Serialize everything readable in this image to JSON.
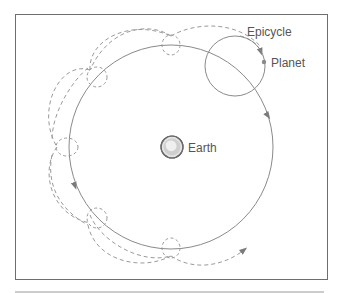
{
  "diagram": {
    "type": "epicycle-model",
    "labels": {
      "epicycle": "Epicycle",
      "planet": "Planet",
      "earth": "Earth"
    },
    "colors": {
      "line": "#8a8a8a",
      "dashed": "#9a9a9a",
      "frame": "#6e6e6e",
      "text": "#555555",
      "earth_fill": "#d4d4d4",
      "planet_dot": "#8a8a8a"
    },
    "elements": {
      "deferent": {
        "cx": 171,
        "cy": 147,
        "r": 102
      },
      "earth": {
        "cx": 172,
        "cy": 147,
        "r": 11
      },
      "main_epicycle": {
        "cx": 235,
        "cy": 66,
        "r": 30
      },
      "planet": {
        "cx": 264,
        "cy": 62
      },
      "small_epicycles": [
        {
          "cx": 171,
          "cy": 45,
          "r": 9
        },
        {
          "cx": 97,
          "cy": 77,
          "r": 10
        },
        {
          "cx": 67,
          "cy": 147,
          "r": 10
        },
        {
          "cx": 97,
          "cy": 218,
          "r": 10
        },
        {
          "cx": 171,
          "cy": 248,
          "r": 9
        }
      ]
    }
  }
}
